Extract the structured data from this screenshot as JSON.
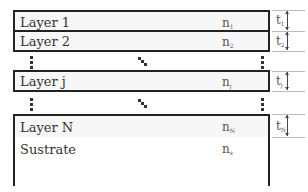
{
  "diagram": {
    "layers": [
      {
        "name": "Layer 1",
        "index_label": "n",
        "index_sub": "1",
        "thickness_label": "t",
        "thickness_sub": "1"
      },
      {
        "name": "Layer 2",
        "index_label": "n",
        "index_sub": "2",
        "thickness_label": "t",
        "thickness_sub": "2"
      },
      {
        "name": "Layer j",
        "index_label": "n",
        "index_sub": "j",
        "thickness_label": "t",
        "thickness_sub": "j"
      },
      {
        "name": "Layer N",
        "index_label": "n",
        "index_sub": "N",
        "thickness_label": "t",
        "thickness_sub": "N"
      }
    ],
    "substrate": {
      "name": "Sustrate",
      "index_label": "n",
      "index_sub": "s"
    },
    "colors": {
      "border": "#222222",
      "layer_fill": "#f7f7f7",
      "guide_line": "#bbbbbb",
      "text": "#333333"
    }
  }
}
